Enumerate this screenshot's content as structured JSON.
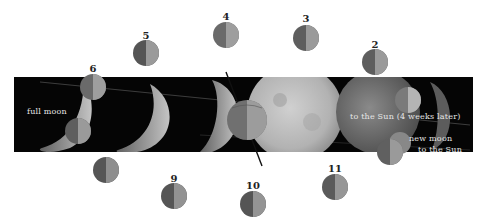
{
  "figure": {
    "background": "#ffffff",
    "band_color": "#050505"
  },
  "band_labels": {
    "full_moon": "full moon",
    "to_sun_later": "to the Sun (4 weeks later)",
    "new_moon": "new moon",
    "to_sun": "to the Sun"
  },
  "moon_positions": [
    {
      "label": "2",
      "x": 375,
      "y": 62
    },
    {
      "label": "3",
      "x": 306,
      "y": 38
    },
    {
      "label": "4",
      "x": 226,
      "y": 35
    },
    {
      "label": "5",
      "x": 146,
      "y": 53
    },
    {
      "label": "6",
      "x": 93,
      "y": 87
    },
    {
      "label": "",
      "x": 106,
      "y": 170
    },
    {
      "label": "9",
      "x": 174,
      "y": 196
    },
    {
      "label": "10",
      "x": 253,
      "y": 204
    },
    {
      "label": "11",
      "x": 335,
      "y": 187
    }
  ],
  "colors": {
    "moon_dark_half": "#5a5a5a",
    "moon_light_half": "#9a9a9a",
    "full_moon": "#b8b8b8",
    "crescent": "#a8a8a8",
    "label_text": "#222222",
    "band_text": "#e6e6e6"
  }
}
